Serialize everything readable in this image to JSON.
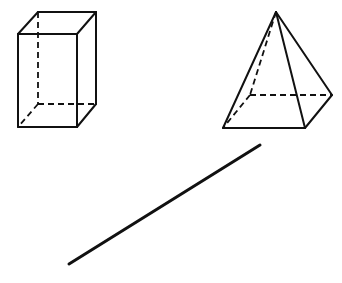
{
  "diagram": {
    "background": "#ffffff",
    "stroke_color": "#111111",
    "figures": [
      {
        "id": "rectangular-prism",
        "type": "rectangular prism",
        "solid_edges": [
          [
            18,
            34,
            77,
            34
          ],
          [
            18,
            34,
            18,
            127
          ],
          [
            18,
            127,
            77,
            127
          ],
          [
            77,
            34,
            77,
            127
          ],
          [
            18,
            34,
            38,
            12
          ],
          [
            38,
            12,
            96,
            12
          ],
          [
            77,
            34,
            96,
            12
          ],
          [
            96,
            12,
            96,
            104
          ],
          [
            77,
            127,
            96,
            104
          ]
        ],
        "hidden_edges": [
          [
            38,
            12,
            38,
            104
          ],
          [
            38,
            104,
            96,
            104
          ],
          [
            38,
            104,
            18,
            127
          ]
        ]
      },
      {
        "id": "square-pyramid",
        "type": "square pyramid",
        "solid_edges": [
          [
            223,
            128,
            305,
            128
          ],
          [
            305,
            128,
            332,
            95
          ],
          [
            276,
            12,
            223,
            128
          ],
          [
            276,
            12,
            305,
            128
          ],
          [
            276,
            12,
            332,
            95
          ]
        ],
        "hidden_edges": [
          [
            250,
            95,
            332,
            95
          ],
          [
            250,
            95,
            223,
            128
          ],
          [
            276,
            12,
            250,
            95
          ]
        ]
      },
      {
        "id": "line-segment",
        "type": "line segment",
        "endpoints": [
          69,
          264,
          260,
          145
        ]
      }
    ]
  }
}
